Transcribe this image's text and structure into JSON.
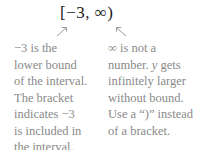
{
  "expression": "[−3, ∞)",
  "left_annotation": {
    "lines": [
      "−3 is the",
      "lower bound",
      "of the interval.",
      "The bracket",
      "indicates −3",
      "is included in",
      "the interval."
    ]
  },
  "right_annotation": {
    "lines": [
      "∞ is not a",
      "number.",
      "y",
      "gets",
      "infinitely larger",
      "without bound.",
      "Use a “)” instead",
      "of a bracket."
    ]
  },
  "colors": {
    "expression": "#1a1a1a",
    "annotation": "#8a8a8a",
    "arrow": "#999999"
  }
}
